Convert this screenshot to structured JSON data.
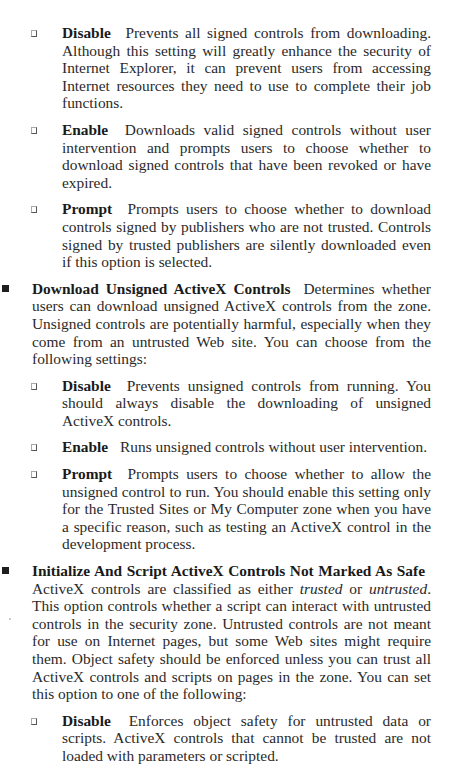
{
  "document": {
    "sections": [
      {
        "type": "sub",
        "term": "Disable",
        "text": "Prevents all signed controls from downloading. Although this setting will greatly enhance the security of Internet Explorer, it can prevent users from accessing Internet resources they need to use to complete their job functions."
      },
      {
        "type": "sub",
        "term": "Enable",
        "text": "Downloads valid signed controls without user intervention and prompts users to choose whether to download signed controls that have been revoked or have expired."
      },
      {
        "type": "sub",
        "term": "Prompt",
        "text": "Prompts users to choose whether to download controls signed by publishers who are not trusted. Controls signed by trusted publishers are silently downloaded even if this option is selected."
      },
      {
        "type": "top",
        "term": "Download Unsigned ActiveX Controls",
        "text": "Determines whether users can download unsigned ActiveX controls from the zone. Unsigned controls are potentially harmful, especially when they come from an untrusted Web site. You can choose from the following settings:"
      },
      {
        "type": "sub",
        "term": "Disable",
        "text": "Prevents unsigned controls from running. You should always disable the downloading of unsigned ActiveX controls."
      },
      {
        "type": "sub",
        "term": "Enable",
        "text": "Runs unsigned controls without user intervention."
      },
      {
        "type": "sub",
        "term": "Prompt",
        "text": "Prompts users to choose whether to allow the unsigned control to run. You should enable this setting only for the Trusted Sites or My Computer zone when you have a specific reason, such as testing an ActiveX control in the development process."
      },
      {
        "type": "top",
        "term": "Initialize And Script ActiveX Controls Not Marked As Safe",
        "text_before": "ActiveX controls are classified as either ",
        "italic1": "trusted",
        "text_mid": " or ",
        "italic2": "untrusted",
        "text_after": ". This option controls whether a script can interact with untrusted controls in the security zone. Untrusted controls are not meant for use on Internet pages, but some Web sites might require them. Object safety should be enforced unless you can trust all ActiveX controls and scripts on pages in the zone. You can set this option to one of the following:"
      },
      {
        "type": "sub",
        "term": "Disable",
        "text": "Enforces object safety for untrusted data or scripts. ActiveX controls that cannot be trusted are not loaded with parameters or scripted."
      }
    ]
  }
}
